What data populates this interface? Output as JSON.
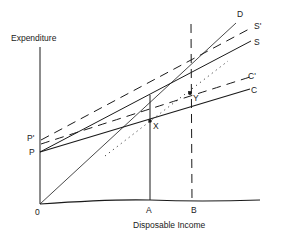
{
  "diagram": {
    "type": "consumption-savings-income diagram",
    "axes": {
      "y_label": "Expenditure",
      "x_label": "Disposable Income",
      "origin_label": "0"
    },
    "lines": [
      {
        "id": "D",
        "label": "D",
        "style": "solid-thin",
        "description": "45-degree line from origin"
      },
      {
        "id": "S_prime",
        "label": "S'",
        "style": "dashed",
        "start_label": "P'"
      },
      {
        "id": "S",
        "label": "S",
        "style": "solid",
        "start_label": "P"
      },
      {
        "id": "C_prime",
        "label": "C'",
        "style": "dashed",
        "start_label": "P'"
      },
      {
        "id": "C",
        "label": "C",
        "style": "solid",
        "start_label": "P"
      },
      {
        "id": "dotted",
        "label": "",
        "style": "dotted",
        "description": "dotted line through X and Y"
      }
    ],
    "intercepts": {
      "p_label": "P",
      "p_prime_label": "P'"
    },
    "points": {
      "x_point": "X",
      "y_point": "Y"
    },
    "x_markers": {
      "a_label": "A",
      "b_label": "B"
    },
    "colors": {
      "ink": "#1a1a1a",
      "background": "#ffffff"
    }
  }
}
